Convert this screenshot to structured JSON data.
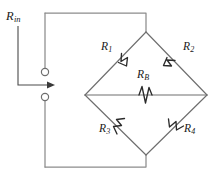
{
  "diagram": {
    "type": "circuit-schematic",
    "colors": {
      "background": "#ffffff",
      "wire": "#8c8c8c",
      "arm": "#6e6e6e",
      "resistor_symbol": "#2b2b2b",
      "label_text": "#1a1a1a",
      "arrow": "#3a3a3a"
    }
  },
  "labels": {
    "input_resistance": {
      "base": "R",
      "sub": "in"
    },
    "r1": {
      "base": "R",
      "sub": "1"
    },
    "r2": {
      "base": "R",
      "sub": "2"
    },
    "rb": {
      "base": "R",
      "sub": "B"
    },
    "r3": {
      "base": "R",
      "sub": "3"
    },
    "r4": {
      "base": "R",
      "sub": "4"
    }
  },
  "components": [
    {
      "id": "r1",
      "kind": "resistor",
      "label": "R1",
      "position": "upper-left-arm"
    },
    {
      "id": "r2",
      "kind": "resistor",
      "label": "R2",
      "position": "upper-right-arm"
    },
    {
      "id": "rb",
      "kind": "resistor",
      "label": "RB",
      "position": "bridge-center-horizontal"
    },
    {
      "id": "r3",
      "kind": "resistor",
      "label": "R3",
      "position": "lower-left-arm"
    },
    {
      "id": "r4",
      "kind": "resistor",
      "label": "R4",
      "position": "lower-right-arm"
    }
  ],
  "terminals": [
    {
      "id": "top-terminal",
      "shape": "open-circle"
    },
    {
      "id": "bottom-terminal",
      "shape": "open-circle"
    }
  ],
  "annotations": [
    {
      "id": "rin-arrow",
      "kind": "arrow",
      "direction": "right",
      "meaning": "input resistance looking into terminals"
    }
  ]
}
